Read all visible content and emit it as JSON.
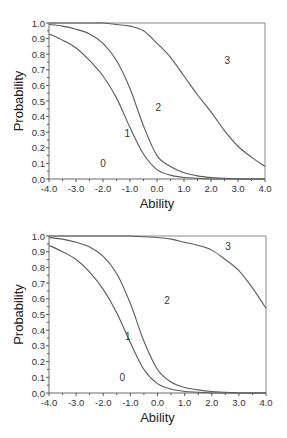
{
  "chart_data": [
    {
      "type": "line",
      "title": "",
      "xlabel": "Ability",
      "ylabel": "Probability",
      "xlim": [
        -4.0,
        4.0
      ],
      "ylim": [
        0.0,
        1.0
      ],
      "grid": false,
      "legend": "none (curve regions labeled in-plot)",
      "x_ticks": [
        "-4.0",
        "-3.0",
        "-2.0",
        "-1.0",
        "0.0",
        "1.0",
        "2.0",
        "3.0",
        "4.0"
      ],
      "y_ticks": [
        "0.0",
        "0.1",
        "0.2",
        "0.3",
        "0.4",
        "0.5",
        "0.6",
        "0.7",
        "0.8",
        "0.9",
        "1.0"
      ],
      "x": [
        -4.0,
        -3.5,
        -3.0,
        -2.5,
        -2.0,
        -1.5,
        -1.0,
        -0.5,
        0.0,
        0.5,
        1.0,
        1.5,
        2.0,
        2.5,
        3.0,
        3.5,
        4.0
      ],
      "series": [
        {
          "name": "P(score >= 1)",
          "values": [
            0.93,
            0.89,
            0.84,
            0.76,
            0.66,
            0.52,
            0.33,
            0.16,
            0.06,
            0.025,
            0.01,
            0.005,
            0.0,
            0.0,
            0.0,
            0.0,
            0.0
          ]
        },
        {
          "name": "P(score >= 2)",
          "values": [
            0.99,
            0.98,
            0.96,
            0.93,
            0.87,
            0.76,
            0.58,
            0.34,
            0.15,
            0.08,
            0.04,
            0.02,
            0.01,
            0.005,
            0.0,
            0.0,
            0.0
          ]
        },
        {
          "name": "P(score >= 3)",
          "values": [
            1.0,
            1.0,
            1.0,
            1.0,
            1.0,
            0.99,
            0.98,
            0.95,
            0.87,
            0.78,
            0.66,
            0.54,
            0.43,
            0.31,
            0.21,
            0.14,
            0.08
          ]
        }
      ],
      "annotations": [
        {
          "text": "0",
          "x": -2.0,
          "y": 0.1
        },
        {
          "text": "1",
          "x": -1.1,
          "y": 0.29
        },
        {
          "text": "2",
          "x": 0.05,
          "y": 0.46
        },
        {
          "text": "3",
          "x": 2.6,
          "y": 0.76
        }
      ]
    },
    {
      "type": "line",
      "title": "",
      "xlabel": "Ability",
      "ylabel": "Probability",
      "xlim": [
        -4.0,
        4.0
      ],
      "ylim": [
        0.0,
        1.0
      ],
      "grid": false,
      "legend": "none (curve regions labeled in-plot)",
      "x_ticks": [
        "-4.0",
        "-3.0",
        "-2.0",
        "-1.0",
        "0.0",
        "1.0",
        "2.0",
        "3.0",
        "4.0"
      ],
      "y_ticks": [
        "0.0",
        "0.1",
        "0.2",
        "0.3",
        "0.4",
        "0.5",
        "0.6",
        "0.7",
        "0.8",
        "0.9",
        "1.0"
      ],
      "x": [
        -4.0,
        -3.5,
        -3.0,
        -2.5,
        -2.0,
        -1.5,
        -1.0,
        -0.5,
        0.0,
        0.5,
        1.0,
        1.5,
        2.0,
        2.5,
        3.0,
        3.5,
        4.0
      ],
      "series": [
        {
          "name": "P(score >= 1)",
          "values": [
            0.94,
            0.9,
            0.85,
            0.77,
            0.66,
            0.51,
            0.32,
            0.15,
            0.06,
            0.025,
            0.01,
            0.005,
            0.0,
            0.0,
            0.0,
            0.0,
            0.0
          ]
        },
        {
          "name": "P(score >= 2)",
          "values": [
            0.99,
            0.98,
            0.96,
            0.93,
            0.87,
            0.76,
            0.57,
            0.33,
            0.15,
            0.07,
            0.035,
            0.02,
            0.01,
            0.005,
            0.0,
            0.0,
            0.0
          ]
        },
        {
          "name": "P(score >= 3)",
          "values": [
            1.0,
            1.0,
            1.0,
            1.0,
            1.0,
            1.0,
            1.0,
            0.995,
            0.99,
            0.98,
            0.96,
            0.94,
            0.91,
            0.85,
            0.78,
            0.67,
            0.54
          ]
        }
      ],
      "annotations": [
        {
          "text": "0",
          "x": -1.3,
          "y": 0.1
        },
        {
          "text": "1",
          "x": -1.1,
          "y": 0.36
        },
        {
          "text": "2",
          "x": 0.35,
          "y": 0.59
        },
        {
          "text": "3",
          "x": 2.6,
          "y": 0.93
        }
      ]
    }
  ],
  "figure": {
    "panels": [
      {
        "id": "top",
        "x_axis_title": "Ability",
        "y_axis_title": "Probability"
      },
      {
        "id": "bottom",
        "x_axis_title": "Ability",
        "y_axis_title": "Probability"
      }
    ]
  }
}
